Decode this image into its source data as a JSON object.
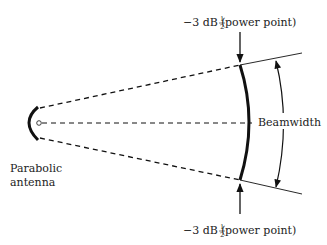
{
  "diagram": {
    "labels": {
      "antenna_line1": "Parabolic",
      "antenna_line2": "antenna",
      "beamwidth": "Beamwidth",
      "top_point_prefix": "−3 dB (",
      "top_point_frac_num": "1",
      "top_point_frac_den": "2",
      "top_point_suffix": " power point)",
      "bottom_point_prefix": "−3 dB (",
      "bottom_point_frac_num": "1",
      "bottom_point_frac_den": "2",
      "bottom_point_suffix": " power point)"
    },
    "colors": {
      "stroke": "#111111",
      "text": "#222222"
    }
  }
}
